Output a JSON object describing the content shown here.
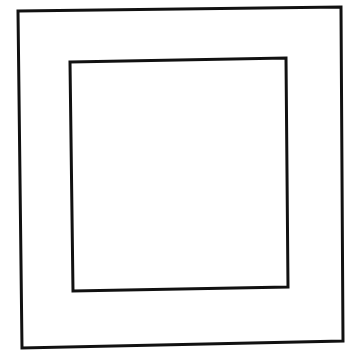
{
  "canvas": {
    "width": 356,
    "height": 357,
    "background": "#ffffff"
  },
  "stroke_color": "#111111",
  "shapes": [
    {
      "name": "outer-square",
      "points": "18,11 341,7 343,341 22,348",
      "stroke_width": 3
    },
    {
      "name": "inner-square",
      "points": "70,62 286,58 288,287 73,291",
      "stroke_width": 3
    }
  ]
}
